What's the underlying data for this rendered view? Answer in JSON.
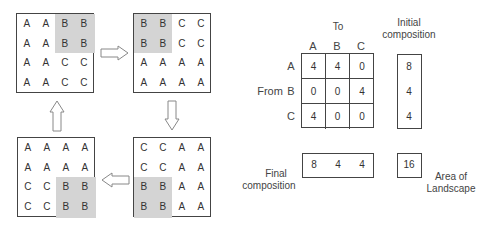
{
  "grids": [
    {
      "name": "grid-step-1",
      "rows": [
        [
          "A",
          "A",
          "B",
          "B"
        ],
        [
          "A",
          "A",
          "B",
          "B"
        ],
        [
          "A",
          "A",
          "C",
          "C"
        ],
        [
          "A",
          "A",
          "C",
          "C"
        ]
      ],
      "shaded": [
        [
          0,
          2
        ],
        [
          0,
          3
        ],
        [
          1,
          2
        ],
        [
          1,
          3
        ]
      ]
    },
    {
      "name": "grid-step-2",
      "rows": [
        [
          "B",
          "B",
          "C",
          "C"
        ],
        [
          "B",
          "B",
          "C",
          "C"
        ],
        [
          "A",
          "A",
          "A",
          "A"
        ],
        [
          "A",
          "A",
          "A",
          "A"
        ]
      ],
      "shaded": [
        [
          0,
          0
        ],
        [
          0,
          1
        ],
        [
          1,
          0
        ],
        [
          1,
          1
        ]
      ]
    },
    {
      "name": "grid-step-3",
      "rows": [
        [
          "C",
          "C",
          "A",
          "A"
        ],
        [
          "C",
          "C",
          "A",
          "A"
        ],
        [
          "B",
          "B",
          "A",
          "A"
        ],
        [
          "B",
          "B",
          "A",
          "A"
        ]
      ],
      "shaded": [
        [
          2,
          0
        ],
        [
          2,
          1
        ],
        [
          3,
          0
        ],
        [
          3,
          1
        ]
      ]
    },
    {
      "name": "grid-step-4",
      "rows": [
        [
          "A",
          "A",
          "A",
          "A"
        ],
        [
          "A",
          "A",
          "A",
          "A"
        ],
        [
          "C",
          "C",
          "B",
          "B"
        ],
        [
          "C",
          "C",
          "B",
          "B"
        ]
      ],
      "shaded": [
        [
          2,
          2
        ],
        [
          2,
          3
        ],
        [
          3,
          2
        ],
        [
          3,
          3
        ]
      ]
    }
  ],
  "matrix": {
    "to_label": "To",
    "from_label": "From",
    "col_headers": [
      "A",
      "B",
      "C"
    ],
    "row_headers": [
      "A",
      "B",
      "C"
    ],
    "values": [
      [
        "4",
        "4",
        "0"
      ],
      [
        "0",
        "0",
        "4"
      ],
      [
        "4",
        "0",
        "0"
      ]
    ]
  },
  "initial": {
    "label_line1": "Initial",
    "label_line2": "composition",
    "values": [
      "8",
      "4",
      "4"
    ]
  },
  "final": {
    "label_line1": "Final",
    "label_line2": "composition",
    "values": [
      "8",
      "4",
      "4"
    ]
  },
  "area": {
    "value": "16",
    "label_line1": "Area of",
    "label_line2": "Landscape"
  },
  "colors": {
    "shade": "#d4d4d4",
    "border": "#444444",
    "text": "#333333"
  }
}
